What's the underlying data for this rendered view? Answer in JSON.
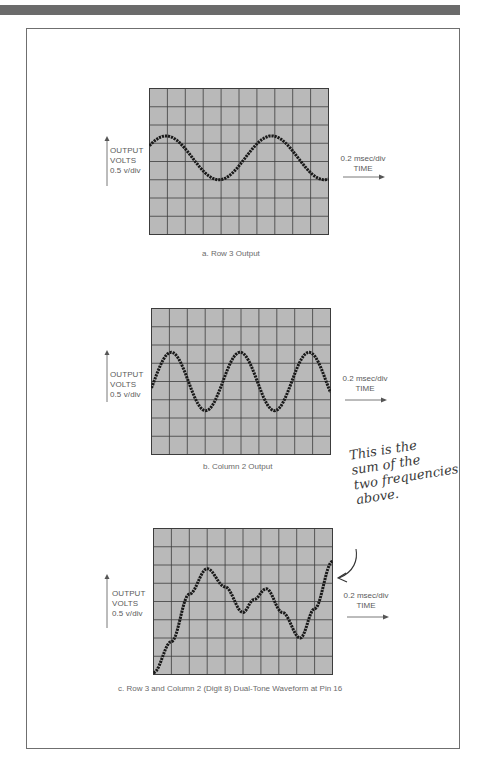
{
  "figure": {
    "panels": [
      {
        "id": "a",
        "y_axis_label": [
          "OUTPUT",
          "VOLTS",
          "0.5 v/div"
        ],
        "x_axis_label": [
          "0.2 msec/div",
          "TIME"
        ],
        "caption": "a. Row 3 Output"
      },
      {
        "id": "b",
        "y_axis_label": [
          "OUTPUT",
          "VOLTS",
          "0.5 v/div"
        ],
        "x_axis_label": [
          "0.2 msec/div",
          "TIME"
        ],
        "caption": "b. Column 2 Output"
      },
      {
        "id": "c",
        "y_axis_label": [
          "OUTPUT",
          "VOLTS",
          "0.5 v/div"
        ],
        "x_axis_label": [
          "0.2 msec/div",
          "TIME"
        ],
        "caption": "c. Row 3 and Column 2 (Digit 8) Dual-Tone Waveform at Pin 16"
      }
    ],
    "annotation": {
      "lines": [
        "This is the",
        "sum of the",
        "two frequencies",
        "above."
      ]
    },
    "colors": {
      "screen": "#b9b9b9",
      "grid": "#3c3c3c",
      "trace": "#1a1a1a",
      "frame": "#6f6f6f",
      "top_bar": "#6b6b6b"
    }
  },
  "chart_data": [
    {
      "type": "line",
      "title": "a. Row 3 Output",
      "xlabel": "TIME (0.2 msec/div)",
      "ylabel": "OUTPUT VOLTS (0.5 v/div)",
      "grid": {
        "columns": 10,
        "rows": 8,
        "on": true
      },
      "x": [
        0,
        1,
        2,
        3,
        4,
        5,
        6,
        7,
        8,
        9,
        10
      ],
      "y_divisions_from_top": [
        4.3,
        3.1,
        2.6,
        3.1,
        4.2,
        5.0,
        4.6,
        3.4,
        2.5,
        3.0,
        4.2
      ],
      "description": "Single sine wave, ~1.75 cycles across screen, amplitude ~1.2 div"
    },
    {
      "type": "line",
      "title": "b. Column 2 Output",
      "xlabel": "TIME (0.2 msec/div)",
      "ylabel": "OUTPUT VOLTS (0.5 v/div)",
      "grid": {
        "columns": 10,
        "rows": 8,
        "on": true
      },
      "peaks_at_div": [
        1.1,
        5.0,
        8.8
      ],
      "troughs_at_div": [
        3.0,
        6.9
      ],
      "y_divisions_from_top": {
        "peak": 2.4,
        "trough": 5.6,
        "start": 4.0,
        "end": 4.8
      },
      "description": "Higher-frequency sine wave, ~2.6 cycles across screen, amplitude ~1.6 div"
    },
    {
      "type": "line",
      "title": "c. Row 3 and Column 2 (Digit 8) Dual-Tone Waveform at Pin 16",
      "xlabel": "TIME (0.2 msec/div)",
      "ylabel": "OUTPUT VOLTS (0.5 v/div)",
      "grid": {
        "columns": 10,
        "rows": 8,
        "on": true
      },
      "x": [
        0,
        1,
        2,
        3,
        4,
        5,
        5.6,
        6.3,
        7.2,
        8.2,
        9,
        10
      ],
      "y_divisions_from_top": [
        7.9,
        6.2,
        3.6,
        2.2,
        3.2,
        4.6,
        3.9,
        3.3,
        4.6,
        6.0,
        4.4,
        1.8
      ],
      "description": "Sum of the two tones"
    }
  ]
}
